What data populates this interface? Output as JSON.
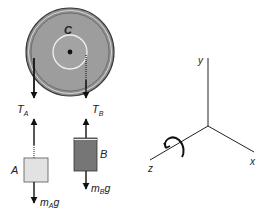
{
  "pulley": {
    "label": "C",
    "colors": {
      "disk": "#9a9a9a",
      "rim": "#444444",
      "hub_ring": "#e8e8e8"
    }
  },
  "rope_left": {
    "tension_label": "T",
    "tension_sub": "A"
  },
  "rope_right": {
    "tension_label": "T",
    "tension_sub": "B"
  },
  "block_a": {
    "label": "A",
    "weight_m": "m",
    "weight_sub": "A",
    "weight_g": "g",
    "color": "#e4e4e4"
  },
  "block_b": {
    "label": "B",
    "weight_m": "m",
    "weight_sub": "B",
    "weight_g": "g",
    "color": "#7a7a7a"
  },
  "axes": {
    "x_label": "x",
    "y_label": "y",
    "z_label": "z",
    "rotation_indicator": "counterclockwise-about-z"
  }
}
